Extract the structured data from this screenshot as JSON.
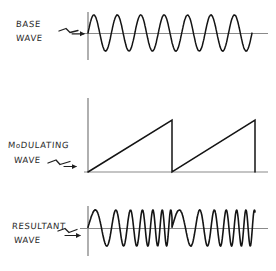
{
  "figure": {
    "title_present": false,
    "background_color": "#ffffff",
    "ink_color": "#1a1a1a",
    "axis_color": "#7a7a7a",
    "style": "hand-drawn pencil sketch"
  },
  "labels": {
    "base_line1": "BASE",
    "base_line2": "WAVE",
    "modulating_line1_a": "M",
    "modulating_line1_b": "o",
    "modulating_line1_c": "DULATING",
    "modulating_line2": "WAVE",
    "resultant_line1": "RESULTANT",
    "resultant_line2": "WAVE"
  },
  "icons": {
    "arrow_base": "squiggle-arrow-icon",
    "arrow_modulating": "squiggle-arrow-icon",
    "arrow_resultant": "squiggle-arrow-icon"
  },
  "chart_data": [
    {
      "type": "line",
      "name": "base-wave",
      "title": "BASE WAVE",
      "waveform": "sine",
      "description": "Constant-frequency carrier sine wave of constant amplitude",
      "cycles": 7,
      "amplitude": 18,
      "frequency_relative": 1.0,
      "axis": {
        "origin_x": 88,
        "baseline_y": 33,
        "x_end": 268,
        "y_top": 12,
        "y_bottom": 60
      },
      "grid": false,
      "xlabel": "",
      "ylabel": ""
    },
    {
      "type": "line",
      "name": "modulating-wave",
      "title": "MODULATING WAVE",
      "waveform": "sawtooth",
      "description": "Ramp sawtooth rising linearly then dropping vertically to zero",
      "cycles": 2,
      "ramp_peak_y": 120,
      "amplitude": 52,
      "axis": {
        "origin_x": 88,
        "baseline_y": 172,
        "x_end": 268,
        "y_top": 98,
        "y_bottom": 172
      },
      "ramps": [
        {
          "x_start": 88,
          "x_peak": 172,
          "y_base": 172,
          "y_peak": 120
        },
        {
          "x_start": 172,
          "x_peak": 255,
          "y_base": 172,
          "y_peak": 120
        }
      ],
      "grid": false,
      "xlabel": "",
      "ylabel": ""
    },
    {
      "type": "line",
      "name": "resultant-wave",
      "title": "RESULTANT WAVE",
      "waveform": "frequency-modulated sine",
      "description": "Carrier frequency sweeps upward across each sawtooth ramp, then resets",
      "modulation_cycles": 2,
      "amplitude": 18,
      "freq_min_relative": 0.75,
      "freq_max_relative": 3.2,
      "axis": {
        "origin_x": 88,
        "baseline_y": 228,
        "x_end": 268,
        "y_top": 206,
        "y_bottom": 256
      },
      "grid": false,
      "xlabel": "",
      "ylabel": ""
    }
  ]
}
